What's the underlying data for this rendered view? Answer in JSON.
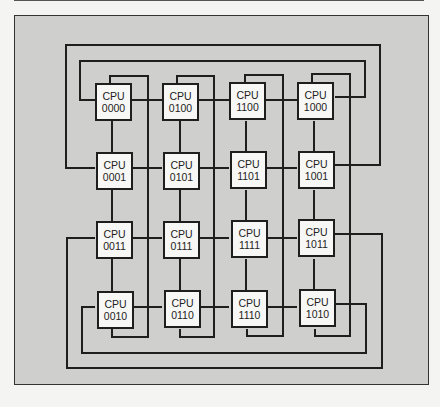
{
  "diagram": {
    "type": "hypercube-interconnect",
    "node_prefix": "CPU",
    "grid": [
      [
        "0000",
        "0100",
        "1100",
        "1000"
      ],
      [
        "0001",
        "0101",
        "1101",
        "1001"
      ],
      [
        "0011",
        "0111",
        "1111",
        "1011"
      ],
      [
        "0010",
        "0110",
        "1110",
        "1010"
      ]
    ],
    "nodes": [
      {
        "label": "CPU",
        "id": "0000"
      },
      {
        "label": "CPU",
        "id": "0100"
      },
      {
        "label": "CPU",
        "id": "1100"
      },
      {
        "label": "CPU",
        "id": "1000"
      },
      {
        "label": "CPU",
        "id": "0001"
      },
      {
        "label": "CPU",
        "id": "0101"
      },
      {
        "label": "CPU",
        "id": "1101"
      },
      {
        "label": "CPU",
        "id": "1001"
      },
      {
        "label": "CPU",
        "id": "0011"
      },
      {
        "label": "CPU",
        "id": "0111"
      },
      {
        "label": "CPU",
        "id": "1111"
      },
      {
        "label": "CPU",
        "id": "1011"
      },
      {
        "label": "CPU",
        "id": "0010"
      },
      {
        "label": "CPU",
        "id": "0110"
      },
      {
        "label": "CPU",
        "id": "1110"
      },
      {
        "label": "CPU",
        "id": "1010"
      }
    ],
    "colors": {
      "frame_fill": "#cfcfcd",
      "node_fill": "#f7f7f5",
      "wire": "#1e1e1e"
    }
  }
}
